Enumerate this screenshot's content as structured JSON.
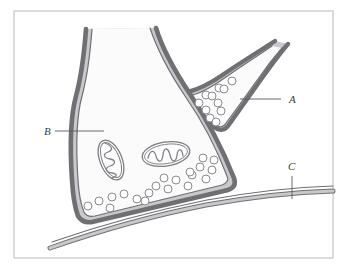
{
  "figure": {
    "frame": {
      "stroke": "#b9b9bd",
      "fill": "#ffffff",
      "x": 14,
      "y": 11,
      "width": 319,
      "height": 247
    },
    "palette": {
      "membrane_outline": "#6f6f74",
      "membrane_fill": "#c9c9cc",
      "cytoplasm_fill": "#fbfbfc",
      "vesicle_outline": "#8a8a8f",
      "vesicle_fill": "#ffffff",
      "mitochondrion_outline": "#7d7d82",
      "mitochondrion_fill": "#fdfdfd",
      "crista_stroke": "#82828a",
      "leader_line": "#5a5a5f",
      "label_text": "#3a3a3a"
    },
    "labels": [
      {
        "id": "A",
        "text": "A",
        "name": "label-a",
        "meaning": "upper-presynaptic-terminal",
        "text_x": 289,
        "text_y": 103,
        "leader": {
          "x1": 240,
          "y1": 99,
          "x2": 281,
          "y2": 99
        }
      },
      {
        "id": "B",
        "text": "B",
        "name": "label-b",
        "meaning": "large-presynaptic-terminal-cytoplasm",
        "text_x": 44,
        "text_y": 135,
        "leader": {
          "x1": 55,
          "y1": 131,
          "x2": 104,
          "y2": 131
        }
      },
      {
        "id": "C",
        "text": "C",
        "name": "label-c",
        "meaning": "postsynaptic-membrane",
        "text_x": 288,
        "text_y": 170,
        "leader": {
          "x1": 292,
          "y1": 176,
          "x2": 292,
          "y2": 199
        }
      }
    ],
    "structures": {
      "large_terminal": {
        "name": "large-presynaptic-terminal",
        "outer_path": "M 86 29 C 84 56 82 74 76 96 C 70 118 70 150 72 180 C 73 197 75 208 78 216 C 81 221 86 223 92 222 L 228 190 C 234 188 236 184 234 178 C 222 148 206 118 190 94 C 174 70 162 48 156 28",
        "inner_path": "M 92 29 C 90 56 88 74 82 96 C 76 118 76 150 78 180 C 79 196 81 205 84 212 C 86 216 90 217 95 216 L 222 185 C 227 183 229 180 227 176 C 216 147 201 119 185 96 C 169 72 157 49 150 28"
      },
      "upper_terminal": {
        "name": "upper-presynaptic-terminal",
        "outer_path": "M 275 41 C 258 52 240 63 224 74 C 208 85 196 90 188 92 C 183 93 182 97 186 101 C 194 110 204 119 214 127 C 219 131 224 131 228 126 C 238 112 250 95 262 78 C 272 64 281 52 288 44",
        "inner_path": "M 272 46 C 256 57 240 67 226 77 C 212 87 200 93 193 95 C 189 96 188 99 191 102 C 198 110 207 118 215 124 C 219 128 223 128 226 123 C 236 110 247 94 258 79 C 267 66 275 56 282 48"
      },
      "postsynaptic_membrane": {
        "name": "postsynaptic-membrane",
        "outer_path": "M 50 248 C 96 232 150 216 206 205 C 256 196 300 192 333 191",
        "inner_path": "M 52 242 C 98 226 152 211 207 200 C 257 191 300 187 333 186"
      }
    },
    "mitochondria": [
      {
        "name": "mitochondrion-left",
        "cx": 111,
        "cy": 160,
        "rx": 11,
        "ry": 21,
        "rotation": -22,
        "crista_path": "M 105 143 C 112 146 114 150 108 152 C 102 154 104 158 110 159 C 116 160 116 164 110 166 C 104 168 106 172 112 173 C 118 174 117 177 112 178"
      },
      {
        "name": "mitochondrion-right",
        "cx": 166,
        "cy": 154,
        "rx": 24,
        "ry": 12,
        "rotation": -9,
        "crista_path": "M 148 158 C 150 150 154 149 156 156 C 158 163 162 163 163 155 C 164 147 168 147 170 155 C 172 163 176 163 177 155 C 178 148 182 148 183 156"
      }
    ],
    "vesicles": {
      "name": "synaptic-vesicles",
      "radius": 4,
      "upper_terminal_positions": [
        [
          206,
          95
        ],
        [
          219,
          88
        ],
        [
          232,
          81
        ],
        [
          199,
          103
        ],
        [
          212,
          96
        ],
        [
          224,
          89
        ],
        [
          206,
          110
        ],
        [
          218,
          103
        ],
        [
          210,
          118
        ],
        [
          221,
          111
        ],
        [
          216,
          122
        ]
      ],
      "large_terminal_positions": [
        [
          88,
          206
        ],
        [
          99,
          201
        ],
        [
          110,
          208
        ],
        [
          112,
          197
        ],
        [
          124,
          194
        ],
        [
          137,
          199
        ],
        [
          149,
          193
        ],
        [
          156,
          186
        ],
        [
          168,
          189
        ],
        [
          164,
          178
        ],
        [
          176,
          180
        ],
        [
          188,
          186
        ],
        [
          192,
          175
        ],
        [
          200,
          167
        ],
        [
          206,
          179
        ],
        [
          212,
          170
        ],
        [
          214,
          160
        ],
        [
          203,
          158
        ],
        [
          190,
          172
        ],
        [
          145,
          201
        ]
      ]
    }
  }
}
